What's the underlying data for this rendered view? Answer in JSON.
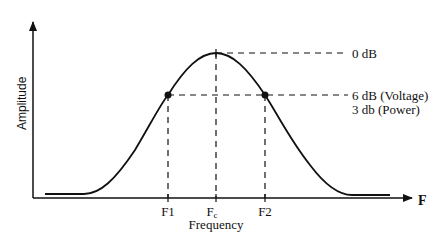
{
  "diagram": {
    "type": "bandpass-response",
    "y_axis_label": "Amplitude",
    "x_axis_label": "Frequency",
    "x_axis_end_label": "F",
    "ticks": [
      {
        "label": "F1",
        "sub": ""
      },
      {
        "label": "F",
        "sub": "c"
      },
      {
        "label": "F2",
        "sub": ""
      }
    ],
    "annotations": {
      "peak": "0 dB",
      "cutoff_line1": "6 dB (Voltage)",
      "cutoff_line2": "3 db (Power)"
    },
    "colors": {
      "line": "#111111",
      "background": "#ffffff"
    }
  }
}
